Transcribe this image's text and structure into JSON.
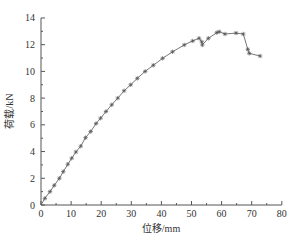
{
  "chart_data": {
    "type": "line",
    "title": "",
    "xlabel": "位移/mm",
    "ylabel": "荷载/kN",
    "xlim": [
      0,
      80
    ],
    "ylim": [
      0,
      14
    ],
    "x_ticks": [
      0,
      10,
      20,
      30,
      40,
      50,
      60,
      70,
      80
    ],
    "y_ticks": [
      0,
      2,
      4,
      6,
      8,
      10,
      12,
      14
    ],
    "grid": false,
    "legend": null,
    "marker": "star",
    "line_style": "solid",
    "color": "#555555",
    "series": [
      {
        "name": "荷载-位移曲线",
        "x": [
          0,
          1.3,
          3.0,
          4.4,
          6.1,
          7.4,
          8.9,
          10.2,
          11.6,
          13.2,
          14.8,
          16.5,
          18.3,
          19.8,
          21.6,
          23.5,
          25.5,
          27.6,
          29.8,
          32.0,
          34.6,
          37.3,
          40.4,
          43.7,
          47.6,
          50.4,
          52.5,
          53.4,
          53.6,
          55.6,
          58.4,
          59.2,
          61.1,
          64.8,
          67.2,
          68.7,
          69.2,
          72.8
        ],
        "y": [
          0,
          0.5,
          1.0,
          1.47,
          2.0,
          2.5,
          3.05,
          3.5,
          3.97,
          4.4,
          5.04,
          5.5,
          6.1,
          6.5,
          7.0,
          7.5,
          8.0,
          8.55,
          9.0,
          9.48,
          10.0,
          10.46,
          10.98,
          11.47,
          11.98,
          12.28,
          12.48,
          12.22,
          11.98,
          12.48,
          12.9,
          12.97,
          12.8,
          12.87,
          12.8,
          11.65,
          11.35,
          11.15
        ]
      }
    ]
  },
  "layout": {
    "origin_px": [
      41,
      205
    ],
    "x_px_per_unit": 3.01,
    "y_px_per_unit": 13.36
  }
}
